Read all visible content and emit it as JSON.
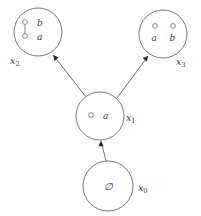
{
  "diagram": {
    "type": "state-transition-graph",
    "background_color": "#ffffff",
    "stroke_color": "#555560",
    "arrow_color": "#2b2b33",
    "text_color": "#3a3a44",
    "nodes": [
      {
        "id": "x0",
        "label": "x",
        "subscript": "0",
        "label_text": "x0",
        "center": {
          "x": 108,
          "y": 186
        },
        "radius": 25,
        "label_position": {
          "x": 139,
          "y": 190
        },
        "content_kind": "empty-set",
        "empty_symbol": "∅",
        "empty_symbol_position": {
          "x": 108,
          "y": 190
        },
        "elements": [],
        "edges": []
      },
      {
        "id": "x1",
        "label": "x",
        "subscript": "1",
        "label_text": "x1",
        "center": {
          "x": 100,
          "y": 116
        },
        "radius": 24,
        "label_position": {
          "x": 127,
          "y": 120
        },
        "content_kind": "vertex-set",
        "elements": [
          {
            "name": "a",
            "circle": {
              "x": 91,
              "y": 115
            },
            "r": 2.4,
            "label_position": {
              "x": 107,
              "y": 119
            }
          }
        ],
        "edges": []
      },
      {
        "id": "x2",
        "label": "x",
        "subscript": "2",
        "label_text": "x2",
        "center": {
          "x": 38,
          "y": 32
        },
        "radius": 24,
        "label_position": {
          "x": 10,
          "y": 62
        },
        "content_kind": "vertex-set",
        "elements": [
          {
            "name": "b",
            "circle": {
              "x": 25,
              "y": 22
            },
            "r": 2.4,
            "label_position": {
              "x": 40,
              "y": 25
            }
          },
          {
            "name": "a",
            "circle": {
              "x": 25,
              "y": 36
            },
            "r": 2.4,
            "label_position": {
              "x": 40,
              "y": 40
            }
          }
        ],
        "edges": [
          {
            "from": {
              "x": 25,
              "y": 24.5
            },
            "to": {
              "x": 25,
              "y": 33.5
            }
          }
        ]
      },
      {
        "id": "x3",
        "label": "x",
        "subscript": "3",
        "label_text": "x3",
        "center": {
          "x": 163,
          "y": 34
        },
        "radius": 24,
        "label_position": {
          "x": 178,
          "y": 63
        },
        "content_kind": "vertex-set",
        "elements": [
          {
            "name": "a",
            "circle": {
              "x": 155,
              "y": 27
            },
            "r": 2.4,
            "label_position": {
              "x": 152,
              "y": 42
            }
          },
          {
            "name": "b",
            "circle": {
              "x": 173,
              "y": 27
            },
            "r": 2.4,
            "label_position": {
              "x": 170,
              "y": 42
            }
          }
        ],
        "edges": []
      }
    ],
    "transitions": [
      {
        "id": "x0-to-x1",
        "from": "x0",
        "to": "x1",
        "start": {
          "x": 106,
          "y": 161
        },
        "end": {
          "x": 101,
          "y": 141
        },
        "arrow_angle_deg": 264
      },
      {
        "id": "x1-to-x2",
        "from": "x1",
        "to": "x2",
        "start": {
          "x": 86,
          "y": 97
        },
        "end": {
          "x": 53,
          "y": 55
        },
        "arrow_angle_deg": 232
      },
      {
        "id": "x1-to-x3",
        "from": "x1",
        "to": "x3",
        "start": {
          "x": 117,
          "y": 98
        },
        "end": {
          "x": 148,
          "y": 56
        },
        "arrow_angle_deg": 307
      }
    ]
  }
}
